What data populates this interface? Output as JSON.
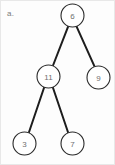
{
  "figure": {
    "label": "a.",
    "width": 115,
    "height": 165,
    "background_color": "#fdfdfd",
    "edge_color": "#1d1d1d",
    "node_fill_color": "#ffffff",
    "node_stroke_color": "#2a2a2a",
    "node_text_color": "#6f6f6f",
    "label_color": "#7b7b7b"
  },
  "chart_data": {
    "type": "diagram",
    "diagram_type": "binary-tree",
    "title": "a.",
    "nodes": [
      {
        "id": "root",
        "value": "6",
        "cx": 71.5,
        "cy": 14.5,
        "r": 11.5
      },
      {
        "id": "n11",
        "value": "11",
        "cx": 47.5,
        "cy": 75.5,
        "r": 11.5
      },
      {
        "id": "n9",
        "value": "9",
        "cx": 97.5,
        "cy": 76.5,
        "r": 11.5
      },
      {
        "id": "n3",
        "value": "3",
        "cx": 23.5,
        "cy": 142.5,
        "r": 11.5
      },
      {
        "id": "n7",
        "value": "7",
        "cx": 71.5,
        "cy": 142.5,
        "r": 11.5
      }
    ],
    "edges": [
      {
        "from": "root",
        "to": "n11",
        "x1": 67.0,
        "y1": 25.8,
        "x2": 52.0,
        "y2": 64.5
      },
      {
        "from": "root",
        "to": "n9",
        "x1": 75.5,
        "y1": 25.4,
        "x2": 93.6,
        "y2": 65.6
      },
      {
        "from": "n11",
        "to": "n3",
        "x1": 43.2,
        "y1": 86.3,
        "x2": 27.8,
        "y2": 131.7
      },
      {
        "from": "n11",
        "to": "n7",
        "x1": 51.8,
        "y1": 86.3,
        "x2": 67.2,
        "y2": 131.7
      }
    ],
    "values": [
      "6",
      "11",
      "9",
      "3",
      "7"
    ],
    "root_value": "6",
    "leaf_values": [
      "9",
      "3",
      "7"
    ]
  }
}
